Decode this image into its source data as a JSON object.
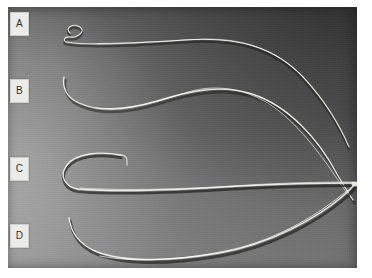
{
  "figure": {
    "kind": "photograph",
    "plate": {
      "x": 8,
      "y": 7,
      "width": 349,
      "height": 261,
      "background_dark": "#5a5a5a",
      "background_light": "#8e8e8e",
      "page_background": "#ffffff"
    },
    "panels": [
      {
        "id": "A",
        "label": "A",
        "label_box": {
          "x": 10,
          "y": 12,
          "width": 17,
          "height": 22
        },
        "chip_fill": "#ebebe8",
        "chip_text_color": "#2f2f2f",
        "tip_shape": "pigtail-loop",
        "highlight_color": "#e8e8e2",
        "shadow_color": "#1d1d1d"
      },
      {
        "id": "B",
        "label": "B",
        "label_box": {
          "x": 10,
          "y": 79,
          "width": 17,
          "height": 22
        },
        "chip_fill": "#ebebe8",
        "chip_text_color": "#2f2f2f",
        "tip_shape": "gentle-s-curve",
        "highlight_color": "#efefe9",
        "shadow_color": "#1d1d1d"
      },
      {
        "id": "C",
        "label": "C",
        "label_box": {
          "x": 10,
          "y": 157,
          "width": 17,
          "height": 22
        },
        "chip_fill": "#ebebe8",
        "chip_text_color": "#2f2f2f",
        "tip_shape": "shepherd-hook",
        "highlight_color": "#efefe9",
        "shadow_color": "#141414"
      },
      {
        "id": "D",
        "label": "D",
        "label_box": {
          "x": 10,
          "y": 224,
          "width": 17,
          "height": 22
        },
        "chip_fill": "#ebebe8",
        "chip_text_color": "#2f2f2f",
        "tip_shape": "long-sweeping-arc",
        "highlight_color": "#efefe9",
        "shadow_color": "#141414"
      }
    ],
    "convergence_point": {
      "x": 349,
      "y": 175
    }
  }
}
